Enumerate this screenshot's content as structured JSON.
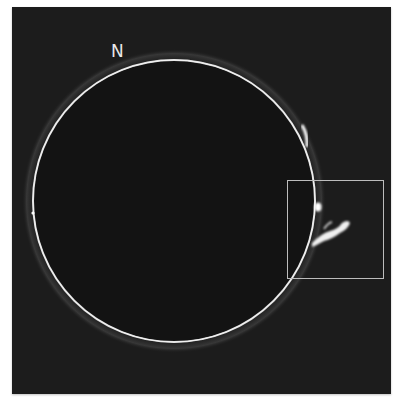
{
  "image": {
    "subject": "solar disk limb with prominence",
    "background_color": "#1c1c1c",
    "limb_color": "#f2f2f2"
  },
  "labels": {
    "north": "N"
  },
  "highlight_box": {
    "color": "#bdbdbd",
    "target": "prominence"
  }
}
